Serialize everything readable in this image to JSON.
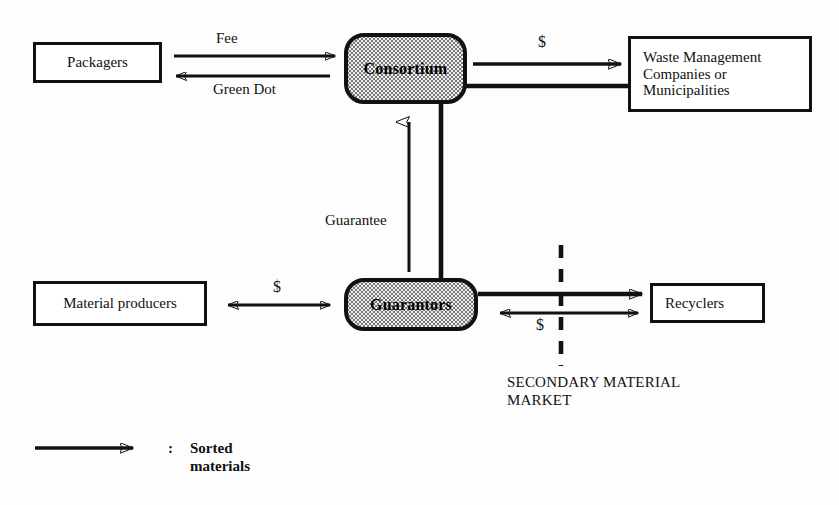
{
  "diagram": {
    "title_visible": false,
    "nodes": {
      "packagers": {
        "label": "Packagers",
        "shape": "rectangle"
      },
      "consortium": {
        "label": "Consortium",
        "shape": "rounded-stippled"
      },
      "waste_management": {
        "label": "Waste Management\nCompanies or\nMunicipalities",
        "shape": "rectangle"
      },
      "material_producers": {
        "label": "Material producers",
        "shape": "rectangle"
      },
      "guarantors": {
        "label": "Guarantors",
        "shape": "rounded-stippled"
      },
      "recyclers": {
        "label": "Recyclers",
        "shape": "rectangle"
      }
    },
    "edge_labels": {
      "fee": "Fee",
      "green_dot": "Green Dot",
      "consortium_to_waste_dollar": "$",
      "guarantee": "Guarantee",
      "material_producers_dollar": "$",
      "secondary_market_dollar": "$"
    },
    "annotations": {
      "secondary_material_market": "SECONDARY MATERIAL\nMARKET"
    },
    "legend": {
      "separator": ":",
      "label": "Sorted\nmaterials"
    },
    "colors": {
      "stroke": "#111111",
      "node_fill": "#ffffff",
      "stippled_fill": "#efefef",
      "background": "#fdfdfd"
    }
  }
}
